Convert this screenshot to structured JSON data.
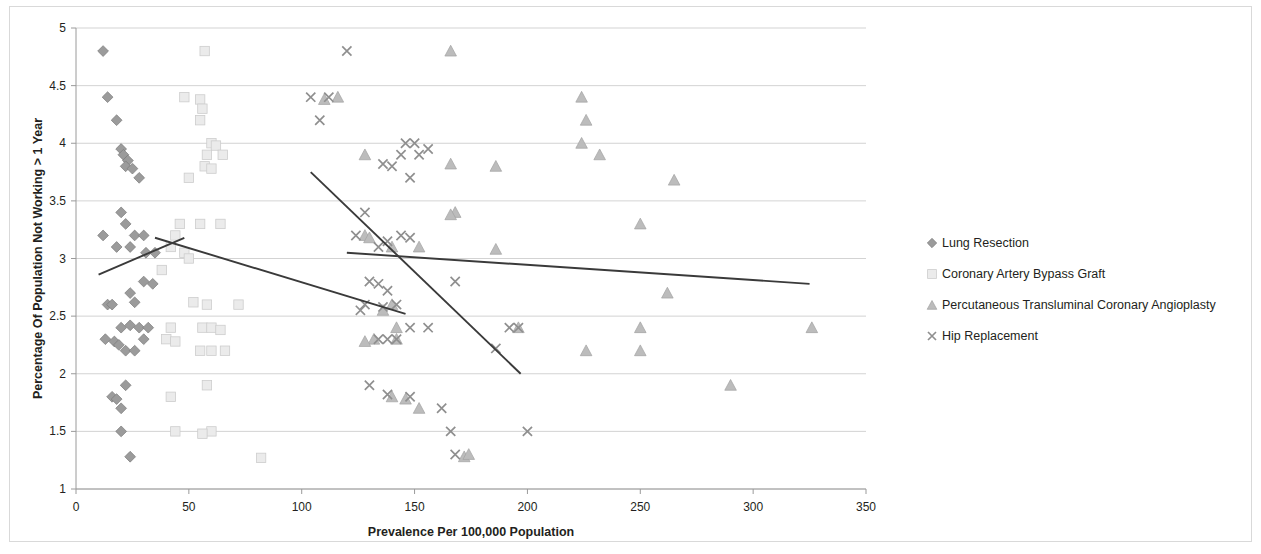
{
  "chart_data": {
    "type": "scatter",
    "title": "",
    "xlabel": "Prevalence Per 100,000 Population",
    "ylabel": "Percentage Of Population Not Working > 1 Year",
    "xlim": [
      0,
      350
    ],
    "ylim": [
      1,
      5
    ],
    "xticks": [
      0,
      50,
      100,
      150,
      200,
      250,
      300,
      350
    ],
    "yticks": [
      1,
      1.5,
      2,
      2.5,
      3,
      3.5,
      4,
      4.5,
      5
    ],
    "xtick_labels": [
      "0",
      "50",
      "100",
      "150",
      "200",
      "250",
      "300",
      "350"
    ],
    "ytick_labels": [
      "1",
      "1.5",
      "2",
      "2.5",
      "3",
      "3.5",
      "4",
      "4.5",
      "5"
    ],
    "grid": "horizontal",
    "legend_position": "right",
    "series": [
      {
        "name": "Lung Resection",
        "marker": "diamond",
        "color": "#9b9b9b",
        "points": [
          [
            12,
            4.8
          ],
          [
            14,
            4.4
          ],
          [
            18,
            4.2
          ],
          [
            20,
            3.95
          ],
          [
            21,
            3.9
          ],
          [
            23,
            3.85
          ],
          [
            22,
            3.8
          ],
          [
            25,
            3.78
          ],
          [
            28,
            3.7
          ],
          [
            12,
            3.2
          ],
          [
            20,
            3.4
          ],
          [
            22,
            3.3
          ],
          [
            26,
            3.2
          ],
          [
            30,
            3.2
          ],
          [
            24,
            3.1
          ],
          [
            18,
            3.1
          ],
          [
            31,
            3.05
          ],
          [
            35,
            3.05
          ],
          [
            14,
            2.6
          ],
          [
            16,
            2.6
          ],
          [
            24,
            2.7
          ],
          [
            26,
            2.62
          ],
          [
            30,
            2.8
          ],
          [
            34,
            2.78
          ],
          [
            20,
            2.4
          ],
          [
            24,
            2.42
          ],
          [
            28,
            2.4
          ],
          [
            32,
            2.4
          ],
          [
            13,
            2.3
          ],
          [
            17,
            2.28
          ],
          [
            19,
            2.25
          ],
          [
            22,
            2.2
          ],
          [
            26,
            2.2
          ],
          [
            30,
            2.3
          ],
          [
            16,
            1.8
          ],
          [
            18,
            1.78
          ],
          [
            22,
            1.9
          ],
          [
            20,
            1.7
          ],
          [
            20,
            1.5
          ],
          [
            24,
            1.28
          ]
        ]
      },
      {
        "name": "Coronary Artery Bypass Graft",
        "marker": "square",
        "color": "#ebebeb",
        "points": [
          [
            57,
            4.8
          ],
          [
            48,
            4.4
          ],
          [
            55,
            4.38
          ],
          [
            56,
            4.3
          ],
          [
            55,
            4.2
          ],
          [
            60,
            4.0
          ],
          [
            62,
            3.98
          ],
          [
            58,
            3.9
          ],
          [
            65,
            3.9
          ],
          [
            57,
            3.8
          ],
          [
            60,
            3.78
          ],
          [
            50,
            3.7
          ],
          [
            46,
            3.3
          ],
          [
            55,
            3.3
          ],
          [
            64,
            3.3
          ],
          [
            44,
            3.2
          ],
          [
            42,
            3.1
          ],
          [
            48,
            3.05
          ],
          [
            50,
            3.0
          ],
          [
            38,
            2.9
          ],
          [
            52,
            2.62
          ],
          [
            58,
            2.6
          ],
          [
            72,
            2.6
          ],
          [
            42,
            2.4
          ],
          [
            56,
            2.4
          ],
          [
            60,
            2.4
          ],
          [
            64,
            2.38
          ],
          [
            40,
            2.3
          ],
          [
            44,
            2.28
          ],
          [
            55,
            2.2
          ],
          [
            60,
            2.2
          ],
          [
            66,
            2.2
          ],
          [
            42,
            1.8
          ],
          [
            58,
            1.9
          ],
          [
            44,
            1.5
          ],
          [
            60,
            1.5
          ],
          [
            56,
            1.48
          ],
          [
            82,
            1.27
          ]
        ]
      },
      {
        "name": "Percutaneous Transluminal Coronary Angioplasty",
        "marker": "triangle",
        "color": "#bcbcbc",
        "points": [
          [
            166,
            4.8
          ],
          [
            224,
            4.4
          ],
          [
            226,
            4.2
          ],
          [
            224,
            4.0
          ],
          [
            232,
            3.9
          ],
          [
            128,
            3.9
          ],
          [
            166,
            3.82
          ],
          [
            186,
            3.8
          ],
          [
            265,
            3.68
          ],
          [
            116,
            4.4
          ],
          [
            110,
            4.38
          ],
          [
            168,
            3.4
          ],
          [
            166,
            3.38
          ],
          [
            250,
            3.3
          ],
          [
            128,
            3.2
          ],
          [
            130,
            3.18
          ],
          [
            140,
            3.1
          ],
          [
            152,
            3.1
          ],
          [
            186,
            3.08
          ],
          [
            262,
            2.7
          ],
          [
            140,
            2.6
          ],
          [
            136,
            2.55
          ],
          [
            142,
            2.4
          ],
          [
            250,
            2.4
          ],
          [
            226,
            2.2
          ],
          [
            250,
            2.2
          ],
          [
            196,
            2.4
          ],
          [
            132,
            2.3
          ],
          [
            128,
            2.28
          ],
          [
            142,
            2.3
          ],
          [
            140,
            1.8
          ],
          [
            146,
            1.78
          ],
          [
            152,
            1.7
          ],
          [
            172,
            1.28
          ],
          [
            174,
            1.3
          ],
          [
            290,
            1.9
          ],
          [
            326,
            2.4
          ]
        ]
      },
      {
        "name": "Hip Replacement",
        "marker": "cross",
        "color": "#8f8f8f",
        "points": [
          [
            120,
            4.8
          ],
          [
            104,
            4.4
          ],
          [
            112,
            4.4
          ],
          [
            108,
            4.2
          ],
          [
            150,
            4.0
          ],
          [
            156,
            3.95
          ],
          [
            144,
            3.9
          ],
          [
            152,
            3.9
          ],
          [
            146,
            4.0
          ],
          [
            136,
            3.82
          ],
          [
            140,
            3.8
          ],
          [
            148,
            3.7
          ],
          [
            128,
            3.4
          ],
          [
            134,
            3.1
          ],
          [
            138,
            3.15
          ],
          [
            144,
            3.2
          ],
          [
            148,
            3.18
          ],
          [
            124,
            3.2
          ],
          [
            168,
            2.8
          ],
          [
            130,
            2.8
          ],
          [
            134,
            2.78
          ],
          [
            138,
            2.72
          ],
          [
            128,
            2.6
          ],
          [
            136,
            2.58
          ],
          [
            142,
            2.6
          ],
          [
            126,
            2.55
          ],
          [
            148,
            2.4
          ],
          [
            156,
            2.4
          ],
          [
            196,
            2.4
          ],
          [
            192,
            2.4
          ],
          [
            186,
            2.22
          ],
          [
            134,
            2.3
          ],
          [
            138,
            2.3
          ],
          [
            142,
            2.3
          ],
          [
            130,
            1.9
          ],
          [
            138,
            1.82
          ],
          [
            148,
            1.8
          ],
          [
            162,
            1.7
          ],
          [
            166,
            1.5
          ],
          [
            200,
            1.5
          ],
          [
            168,
            1.3
          ]
        ]
      }
    ],
    "trendlines": [
      {
        "name": "Lung Resection trend",
        "series": "Lung Resection",
        "x0": 10,
        "y0": 2.86,
        "x1": 48,
        "y1": 3.18,
        "slope_direction": "up"
      },
      {
        "name": "Coronary Artery Bypass Graft trend",
        "series": "Coronary Artery Bypass Graft",
        "x0": 35,
        "y0": 3.18,
        "x1": 146,
        "y1": 2.52,
        "slope_direction": "down"
      },
      {
        "name": "Hip Replacement trend",
        "series": "Hip Replacement",
        "x0": 104,
        "y0": 3.75,
        "x1": 197,
        "y1": 2.0,
        "slope_direction": "down-steep"
      },
      {
        "name": "Percutaneous Transluminal Coronary Angioplasty trend",
        "series": "Percutaneous Transluminal Coronary Angioplasty",
        "x0": 120,
        "y0": 3.05,
        "x1": 325,
        "y1": 2.78,
        "slope_direction": "down-shallow"
      }
    ]
  },
  "legend": {
    "items": [
      {
        "label": "Lung Resection",
        "marker": "diamond-marker-icon"
      },
      {
        "label": "Coronary Artery Bypass Graft",
        "marker": "square-marker-icon"
      },
      {
        "label": "Percutaneous Transluminal Coronary Angioplasty",
        "marker": "triangle-marker-icon"
      },
      {
        "label": "Hip Replacement",
        "marker": "cross-marker-icon"
      }
    ]
  },
  "axes": {
    "x_title": "Prevalence Per 100,000 Population",
    "y_title": "Percentage Of Population Not Working > 1 Year"
  }
}
